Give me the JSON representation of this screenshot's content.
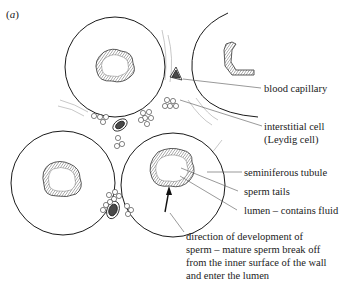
{
  "figure": {
    "panel_label": "a",
    "labels": {
      "blood_capillary": "blood capillary",
      "interstitial_cell_line1": "interstitial cell",
      "interstitial_cell_line2": "(Leydig cell)",
      "seminiferous_tubule": "seminiferous tubule",
      "sperm_tails": "sperm tails",
      "lumen": "lumen – contains fluid",
      "direction_line1": "direction of development of",
      "direction_line2": "sperm –  mature sperm break off",
      "direction_line3": "from the inner surface of the wall",
      "direction_line4": "and enter the lumen"
    },
    "caption_partial": "Figure caption (cut off, illegible)",
    "colors": {
      "line": "#1a1a1a",
      "capillary_fill": "#4a4a4a",
      "hatch": "#555555",
      "faint_line": "#b0b0b0"
    }
  }
}
